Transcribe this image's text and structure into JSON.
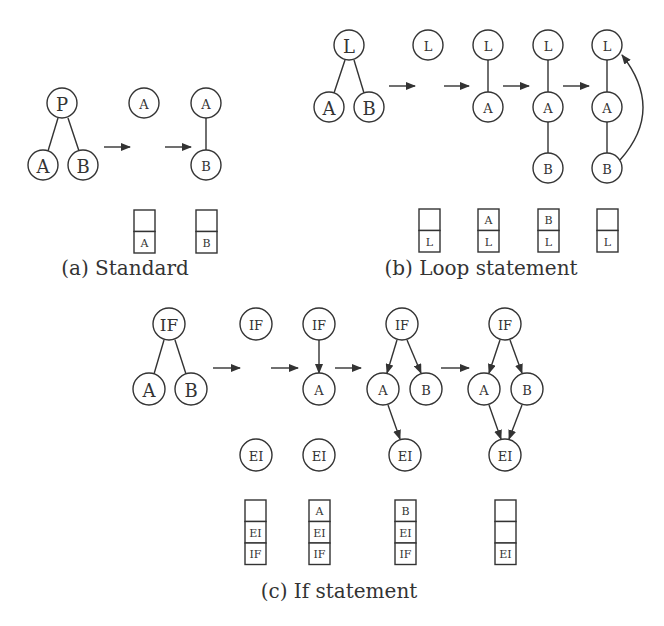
{
  "colors": {
    "stroke": "#333333",
    "background": "#ffffff"
  },
  "panels": [
    {
      "id": "a",
      "caption": {
        "text": "(a) Standard",
        "x": 125,
        "y": 275
      },
      "nodes": [
        {
          "label": "P",
          "x": 62,
          "y": 103,
          "r": 15,
          "fs": 18
        },
        {
          "label": "A",
          "x": 43,
          "y": 165,
          "r": 15,
          "fs": 18
        },
        {
          "label": "B",
          "x": 83,
          "y": 165,
          "r": 15,
          "fs": 18
        },
        {
          "label": "A",
          "x": 144,
          "y": 103,
          "r": 15,
          "fs": 13
        },
        {
          "label": "A",
          "x": 206,
          "y": 103,
          "r": 15,
          "fs": 13
        },
        {
          "label": "B",
          "x": 206,
          "y": 165,
          "r": 15,
          "fs": 13
        }
      ],
      "lines": [
        {
          "x1": 58,
          "y1": 118,
          "x2": 48,
          "y2": 151,
          "arrow": false
        },
        {
          "x1": 68,
          "y1": 118,
          "x2": 79,
          "y2": 151,
          "arrow": false
        },
        {
          "x1": 206,
          "y1": 118,
          "x2": 206,
          "y2": 150,
          "arrow": false
        }
      ],
      "arrows": [
        {
          "x1": 104,
          "y1": 147,
          "x2": 130,
          "y2": 147
        },
        {
          "x1": 165,
          "y1": 147,
          "x2": 191,
          "y2": 147
        }
      ],
      "stacks": [
        {
          "x": 134,
          "y": 210,
          "w": 21,
          "cells": [
            "",
            "A"
          ]
        },
        {
          "x": 196,
          "y": 210,
          "w": 21,
          "cells": [
            "",
            "B"
          ]
        }
      ]
    },
    {
      "id": "b",
      "caption": {
        "text": "(b) Loop statement",
        "x": 481,
        "y": 275
      },
      "nodes": [
        {
          "label": "L",
          "x": 349,
          "y": 45,
          "r": 15,
          "fs": 18
        },
        {
          "label": "A",
          "x": 329,
          "y": 107,
          "r": 15,
          "fs": 18
        },
        {
          "label": "B",
          "x": 369,
          "y": 107,
          "r": 15,
          "fs": 18
        },
        {
          "label": "L",
          "x": 428,
          "y": 45,
          "r": 15,
          "fs": 13
        },
        {
          "label": "L",
          "x": 488,
          "y": 45,
          "r": 15,
          "fs": 13
        },
        {
          "label": "A",
          "x": 488,
          "y": 107,
          "r": 15,
          "fs": 13
        },
        {
          "label": "L",
          "x": 548,
          "y": 45,
          "r": 15,
          "fs": 13
        },
        {
          "label": "A",
          "x": 548,
          "y": 107,
          "r": 15,
          "fs": 13
        },
        {
          "label": "B",
          "x": 548,
          "y": 168,
          "r": 15,
          "fs": 13
        },
        {
          "label": "L",
          "x": 607,
          "y": 45,
          "r": 15,
          "fs": 13
        },
        {
          "label": "A",
          "x": 607,
          "y": 107,
          "r": 15,
          "fs": 13
        },
        {
          "label": "B",
          "x": 607,
          "y": 168,
          "r": 15,
          "fs": 13
        }
      ],
      "lines": [
        {
          "x1": 345,
          "y1": 60,
          "x2": 334,
          "y2": 93,
          "arrow": false
        },
        {
          "x1": 354,
          "y1": 60,
          "x2": 364,
          "y2": 93,
          "arrow": false
        },
        {
          "x1": 488,
          "y1": 60,
          "x2": 488,
          "y2": 92,
          "arrow": false
        },
        {
          "x1": 548,
          "y1": 60,
          "x2": 548,
          "y2": 92,
          "arrow": false
        },
        {
          "x1": 548,
          "y1": 122,
          "x2": 548,
          "y2": 153,
          "arrow": false
        },
        {
          "x1": 607,
          "y1": 60,
          "x2": 607,
          "y2": 92,
          "arrow": false
        },
        {
          "x1": 607,
          "y1": 122,
          "x2": 607,
          "y2": 153,
          "arrow": false
        }
      ],
      "curves": [
        {
          "d": "M 620 160 Q 665 110 622 55",
          "arrow": true
        }
      ],
      "arrows": [
        {
          "x1": 389,
          "y1": 86,
          "x2": 415,
          "y2": 86
        },
        {
          "x1": 444,
          "y1": 86,
          "x2": 469,
          "y2": 86
        },
        {
          "x1": 503,
          "y1": 86,
          "x2": 529,
          "y2": 86
        },
        {
          "x1": 563,
          "y1": 86,
          "x2": 589,
          "y2": 86
        }
      ],
      "stacks": [
        {
          "x": 419,
          "y": 209,
          "w": 21,
          "cells": [
            "",
            "L"
          ]
        },
        {
          "x": 478,
          "y": 209,
          "w": 21,
          "cells": [
            "A",
            "L"
          ]
        },
        {
          "x": 538,
          "y": 209,
          "w": 21,
          "cells": [
            "B",
            "L"
          ]
        },
        {
          "x": 597,
          "y": 209,
          "w": 21,
          "cells": [
            "",
            "L"
          ]
        }
      ]
    },
    {
      "id": "c",
      "caption": {
        "text": "(c) If statement",
        "x": 339,
        "y": 598
      },
      "nodes": [
        {
          "label": "IF",
          "x": 169,
          "y": 324,
          "r": 16,
          "fs": 17
        },
        {
          "label": "A",
          "x": 149,
          "y": 389,
          "r": 16,
          "fs": 18
        },
        {
          "label": "B",
          "x": 191,
          "y": 389,
          "r": 16,
          "fs": 18
        },
        {
          "label": "IF",
          "x": 256,
          "y": 324,
          "r": 16,
          "fs": 13
        },
        {
          "label": "EI",
          "x": 256,
          "y": 455,
          "r": 16,
          "fs": 13
        },
        {
          "label": "IF",
          "x": 319,
          "y": 324,
          "r": 16,
          "fs": 13
        },
        {
          "label": "A",
          "x": 319,
          "y": 389,
          "r": 16,
          "fs": 13
        },
        {
          "label": "EI",
          "x": 319,
          "y": 455,
          "r": 16,
          "fs": 13
        },
        {
          "label": "IF",
          "x": 402,
          "y": 324,
          "r": 16,
          "fs": 13
        },
        {
          "label": "A",
          "x": 383,
          "y": 389,
          "r": 16,
          "fs": 13
        },
        {
          "label": "B",
          "x": 426,
          "y": 389,
          "r": 16,
          "fs": 13
        },
        {
          "label": "EI",
          "x": 405,
          "y": 455,
          "r": 16,
          "fs": 13
        },
        {
          "label": "IF",
          "x": 505,
          "y": 324,
          "r": 16,
          "fs": 13
        },
        {
          "label": "A",
          "x": 484,
          "y": 389,
          "r": 16,
          "fs": 13
        },
        {
          "label": "B",
          "x": 527,
          "y": 389,
          "r": 16,
          "fs": 13
        },
        {
          "label": "EI",
          "x": 505,
          "y": 455,
          "r": 16,
          "fs": 13
        }
      ],
      "lines": [
        {
          "x1": 164,
          "y1": 340,
          "x2": 154,
          "y2": 374,
          "arrow": false
        },
        {
          "x1": 175,
          "y1": 340,
          "x2": 186,
          "y2": 374,
          "arrow": false
        },
        {
          "x1": 319,
          "y1": 340,
          "x2": 319,
          "y2": 373,
          "arrow": true
        },
        {
          "x1": 397,
          "y1": 340,
          "x2": 387,
          "y2": 373,
          "arrow": true
        },
        {
          "x1": 407,
          "y1": 340,
          "x2": 421,
          "y2": 373,
          "arrow": true
        },
        {
          "x1": 388,
          "y1": 405,
          "x2": 400,
          "y2": 439,
          "arrow": true
        },
        {
          "x1": 500,
          "y1": 340,
          "x2": 489,
          "y2": 373,
          "arrow": true
        },
        {
          "x1": 510,
          "y1": 340,
          "x2": 522,
          "y2": 373,
          "arrow": true
        },
        {
          "x1": 489,
          "y1": 405,
          "x2": 501,
          "y2": 439,
          "arrow": true
        },
        {
          "x1": 522,
          "y1": 405,
          "x2": 509,
          "y2": 439,
          "arrow": true
        }
      ],
      "arrows": [
        {
          "x1": 213,
          "y1": 368,
          "x2": 240,
          "y2": 368
        },
        {
          "x1": 271,
          "y1": 368,
          "x2": 298,
          "y2": 368
        },
        {
          "x1": 335,
          "y1": 368,
          "x2": 361,
          "y2": 368
        },
        {
          "x1": 441,
          "y1": 368,
          "x2": 469,
          "y2": 368
        }
      ],
      "stacks": [
        {
          "x": 245,
          "y": 500,
          "w": 21,
          "cells": [
            "",
            "EI",
            "IF"
          ]
        },
        {
          "x": 309,
          "y": 500,
          "w": 21,
          "cells": [
            "A",
            "EI",
            "IF"
          ]
        },
        {
          "x": 395,
          "y": 500,
          "w": 21,
          "cells": [
            "B",
            "EI",
            "IF"
          ]
        },
        {
          "x": 495,
          "y": 500,
          "w": 21,
          "cells": [
            "",
            "",
            "EI"
          ]
        }
      ]
    }
  ]
}
